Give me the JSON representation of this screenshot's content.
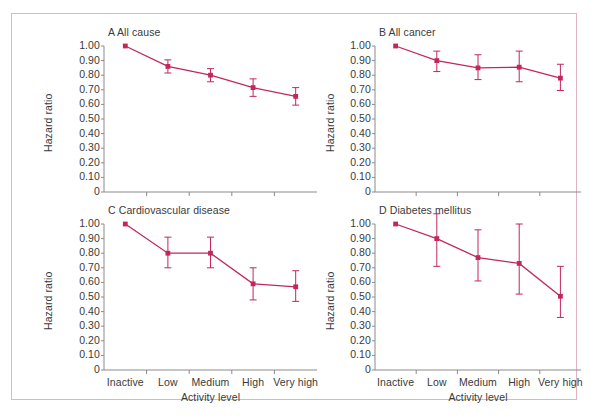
{
  "figure": {
    "accent_color": "#c2275b",
    "frame_color": "#e0b4c4",
    "text_color": "#3a3a3a",
    "background": "#ffffff",
    "x_axis_label": "Activity level",
    "y_axis_label": "Hazard ratio",
    "y_tick_labels": [
      "1.00",
      "0.90",
      "0.80",
      "0.70",
      "0.60",
      "0.50",
      "0.40",
      "0.30",
      "0.20",
      "0.10",
      "0"
    ],
    "x_tick_labels": [
      "Inactive",
      "Low",
      "Medium",
      "High",
      "Very high"
    ]
  },
  "chart_data": [
    {
      "type": "line",
      "panel": "A",
      "title": "A All cause",
      "categories": [
        "Inactive",
        "Low",
        "Medium",
        "High",
        "Very high"
      ],
      "values": [
        1.0,
        0.86,
        0.8,
        0.715,
        0.655
      ],
      "ci_low": [
        1.0,
        0.815,
        0.755,
        0.655,
        0.595
      ],
      "ci_high": [
        1.0,
        0.905,
        0.845,
        0.775,
        0.715
      ],
      "xlabel": "Activity level",
      "ylabel": "Hazard ratio",
      "ylim": [
        0,
        1.0
      ],
      "yticks": [
        1.0,
        0.9,
        0.8,
        0.7,
        0.6,
        0.5,
        0.4,
        0.3,
        0.2,
        0.1,
        0
      ],
      "grid": false,
      "legend": "none"
    },
    {
      "type": "line",
      "panel": "B",
      "title": "B All cancer",
      "categories": [
        "Inactive",
        "Low",
        "Medium",
        "High",
        "Very high"
      ],
      "values": [
        1.0,
        0.9,
        0.85,
        0.855,
        0.78
      ],
      "ci_low": [
        1.0,
        0.825,
        0.77,
        0.755,
        0.695
      ],
      "ci_high": [
        1.0,
        0.965,
        0.94,
        0.965,
        0.875
      ],
      "xlabel": "Activity level",
      "ylabel": "Hazard ratio",
      "ylim": [
        0,
        1.0
      ],
      "yticks": [
        1.0,
        0.9,
        0.8,
        0.7,
        0.6,
        0.5,
        0.4,
        0.3,
        0.2,
        0.1,
        0
      ],
      "grid": false,
      "legend": "none"
    },
    {
      "type": "line",
      "panel": "C",
      "title": "C Cardiovascular disease",
      "categories": [
        "Inactive",
        "Low",
        "Medium",
        "High",
        "Very high"
      ],
      "values": [
        1.0,
        0.8,
        0.8,
        0.59,
        0.57
      ],
      "ci_low": [
        1.0,
        0.7,
        0.7,
        0.48,
        0.47
      ],
      "ci_high": [
        1.0,
        0.91,
        0.91,
        0.7,
        0.68
      ],
      "xlabel": "Activity level",
      "ylabel": "Hazard ratio",
      "ylim": [
        0,
        1.0
      ],
      "yticks": [
        1.0,
        0.9,
        0.8,
        0.7,
        0.6,
        0.5,
        0.4,
        0.3,
        0.2,
        0.1,
        0
      ],
      "grid": false,
      "legend": "none"
    },
    {
      "type": "line",
      "panel": "D",
      "title": "D Diabetes mellitus",
      "categories": [
        "Inactive",
        "Low",
        "Medium",
        "High",
        "Very high"
      ],
      "values": [
        1.0,
        0.9,
        0.77,
        0.73,
        0.505
      ],
      "ci_low": [
        1.0,
        0.71,
        0.61,
        0.52,
        0.36
      ],
      "ci_high": [
        1.0,
        1.07,
        0.96,
        1.0,
        0.71
      ],
      "xlabel": "Activity level",
      "ylabel": "Hazard ratio",
      "ylim": [
        0,
        1.0
      ],
      "yticks": [
        1.0,
        0.9,
        0.8,
        0.7,
        0.6,
        0.5,
        0.4,
        0.3,
        0.2,
        0.1,
        0
      ],
      "grid": false,
      "legend": "none"
    }
  ]
}
